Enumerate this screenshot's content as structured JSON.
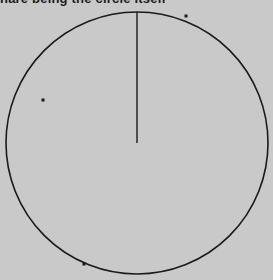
{
  "caption": "hare being the circle itself",
  "figure": {
    "type": "circle-with-radius",
    "center": [
      137,
      143
    ],
    "radius": 131,
    "radius_line_to": [
      137,
      12
    ],
    "stroke_color": "#1a1a1a",
    "background_color": "#c9c9c9",
    "dots": [
      {
        "x": 43,
        "y": 100
      },
      {
        "x": 186,
        "y": 16
      },
      {
        "x": 84,
        "y": 264
      }
    ]
  }
}
